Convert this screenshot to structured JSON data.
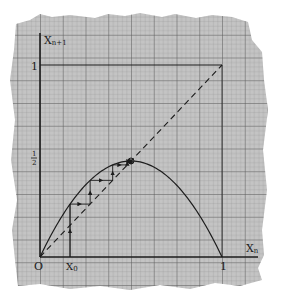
{
  "diagram": {
    "type": "cobweb-plot",
    "paper": {
      "color": "#bdbdbd",
      "fine_grid_color": "#8f8f8f",
      "major_grid_color": "#5a5a5a"
    },
    "ink_color": "#1c1c1c",
    "axes": {
      "y_label": "X",
      "y_label_sub": "n+1",
      "x_label": "X",
      "x_label_sub": "n",
      "origin_label": "O",
      "y_tick_one": "1",
      "y_tick_half_num": "1",
      "y_tick_half_den": "2",
      "x_tick_one": "1",
      "x0_label": "X",
      "x0_label_sub": "0"
    },
    "map": {
      "function": "x_{n+1} = r x_n (1 - x_n)",
      "r": 2.0,
      "x0": 0.165,
      "iterations": 6,
      "fixed_point": 0.5
    },
    "diagonal": "dashed line x_{n+1} = x_n",
    "unit_box": "square frame from (0,0) to (1,1)"
  },
  "chart_data": {
    "type": "line",
    "title": "",
    "xlabel": "X_n",
    "ylabel": "X_{n+1}",
    "xlim": [
      0,
      1
    ],
    "ylim": [
      0,
      1
    ],
    "ticks_x": [
      "O",
      "X_0",
      "1"
    ],
    "ticks_y": [
      "1/2",
      "1"
    ],
    "series": [
      {
        "name": "logistic parabola",
        "style": "solid",
        "x": [
          0,
          0.1,
          0.2,
          0.3,
          0.4,
          0.5,
          0.6,
          0.7,
          0.8,
          0.9,
          1.0
        ],
        "y": [
          0,
          0.18,
          0.32,
          0.42,
          0.48,
          0.5,
          0.48,
          0.42,
          0.32,
          0.18,
          0
        ]
      },
      {
        "name": "diagonal",
        "style": "dashed",
        "x": [
          0,
          1
        ],
        "y": [
          0,
          1
        ]
      },
      {
        "name": "cobweb",
        "style": "solid-with-arrows",
        "start_x": 0.165
      }
    ],
    "annotations": [
      {
        "type": "circle",
        "x": 0.5,
        "y": 0.5,
        "label": "fixed point"
      }
    ]
  }
}
